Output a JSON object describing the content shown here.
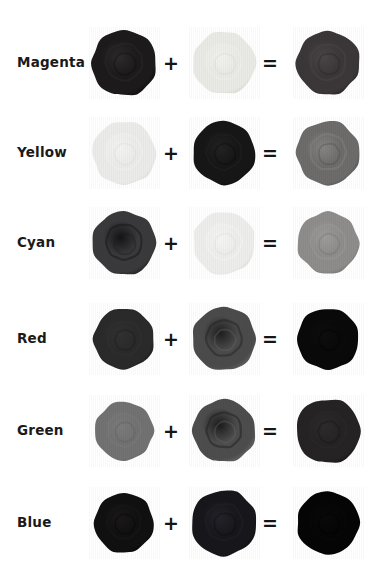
{
  "figure": {
    "background_color": "#ffffff",
    "operator_plus": "+",
    "operator_equals": "=",
    "text_color": "#1a1a1a"
  },
  "rows": [
    {
      "label": "Magenta",
      "top": 18,
      "a": {
        "name": "magenta-blob",
        "fill": "#1c1a1b",
        "rim": "#0d0c0d",
        "core": "#2e2b2d",
        "shape": 0,
        "size": 66
      },
      "b": {
        "name": "yellow-blob",
        "fill": "#eaeae6",
        "rim": "#d9d9d3",
        "core": "#f2f2ee",
        "shape": 1,
        "size": 63
      },
      "c": {
        "name": "red-result-blob",
        "fill": "#3b3739",
        "rim": "#262223",
        "core": "#4a4648",
        "shape": 2,
        "size": 64
      }
    },
    {
      "label": "Yellow",
      "top": 108,
      "a": {
        "name": "yellow-blob",
        "fill": "#ececea",
        "rim": "#dcdcd8",
        "core": "#f4f4f2",
        "shape": 3,
        "size": 64
      },
      "b": {
        "name": "cyan-blob",
        "fill": "#161617",
        "rim": "#0a0a0b",
        "core": "#222223",
        "shape": 4,
        "size": 63
      },
      "c": {
        "name": "green-result-blob",
        "fill": "#6e6c6b",
        "rim": "#4d4b4a",
        "core": "#868483",
        "shape": 5,
        "size": 64
      }
    },
    {
      "label": "Cyan",
      "top": 198,
      "a": {
        "name": "cyan-blob",
        "fill": "#3a3a3c",
        "rim": "#1b1b1d",
        "core": "#141416",
        "shape": 6,
        "size": 64
      },
      "b": {
        "name": "yellow-blob",
        "fill": "#eeeeec",
        "rim": "#dedede",
        "core": "#f6f6f4",
        "shape": 7,
        "size": 63
      },
      "c": {
        "name": "green-result-blob",
        "fill": "#8e8d8b",
        "rim": "#737270",
        "core": "#9d9c9a",
        "shape": 8,
        "size": 62
      }
    },
    {
      "label": "Red",
      "top": 294,
      "a": {
        "name": "red-blob",
        "fill": "#2b2a2b",
        "rim": "#1b1a1b",
        "core": "#323132",
        "shape": 9,
        "size": 61
      },
      "b": {
        "name": "cyan-blob",
        "fill": "#4c4b4c",
        "rim": "#6a696a",
        "core": "#201f20",
        "shape": 10,
        "size": 64
      },
      "c": {
        "name": "black-result-blob",
        "fill": "#0a090a",
        "rim": "#040404",
        "core": "#0e0d0e",
        "shape": 11,
        "size": 62
      }
    },
    {
      "label": "Green",
      "top": 386,
      "a": {
        "name": "green-blob",
        "fill": "#737272",
        "rim": "#5e5d5d",
        "core": "#7c7b7b",
        "shape": 12,
        "size": 59
      },
      "b": {
        "name": "magenta-blob",
        "fill": "#4e4d4e",
        "rim": "#6b6a6b",
        "core": "#1c1b1c",
        "shape": 13,
        "size": 63
      },
      "c": {
        "name": "black-result-blob",
        "fill": "#252324",
        "rim": "#151314",
        "core": "#2d2b2c",
        "shape": 14,
        "size": 65
      }
    },
    {
      "label": "Blue",
      "top": 478,
      "a": {
        "name": "blue-blob",
        "fill": "#111011",
        "rim": "#070607",
        "core": "#1a1819",
        "shape": 15,
        "size": 60
      },
      "b": {
        "name": "yellow-blob",
        "fill": "#17161a",
        "rim": "#0b0a0d",
        "core": "#242329",
        "shape": 16,
        "size": 66
      },
      "c": {
        "name": "black-result-blob",
        "fill": "#060506",
        "rim": "#020202",
        "core": "#0a090a",
        "shape": 17,
        "size": 63
      }
    }
  ]
}
